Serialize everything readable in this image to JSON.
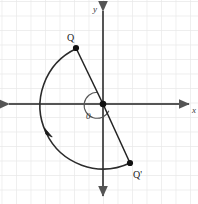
{
  "figure": {
    "width": 198,
    "height": 204,
    "background_color": "#ffffff",
    "grid": {
      "visible": true,
      "spacing_px": 14.5,
      "color": "#e8e8e8"
    },
    "axes": {
      "color": "#555555",
      "origin_px": [
        103,
        104
      ],
      "x_axis": {
        "label": "x",
        "label_pos_px": [
          191,
          110
        ],
        "arrows": "both"
      },
      "y_axis": {
        "label": "y",
        "label_pos_px": [
          95,
          12
        ],
        "arrows": "both"
      },
      "origin_label": {
        "text": "0",
        "pos_px": [
          87,
          117
        ]
      }
    },
    "points": [
      {
        "name": "Q",
        "label": "Q",
        "pos_px": [
          76,
          48
        ],
        "label_pos_px": [
          69,
          41
        ],
        "radius_px": 3.1,
        "color": "#111111"
      },
      {
        "name": "Qp",
        "label": "Q'",
        "pos_px": [
          130,
          163
        ],
        "label_pos_px": [
          134,
          179
        ],
        "radius_px": 3.1,
        "color": "#111111"
      }
    ],
    "segments": [
      {
        "name": "origin-to-Q",
        "from_px": [
          103,
          104
        ],
        "to_px": [
          76,
          48
        ],
        "color": "#222222"
      },
      {
        "name": "origin-to-Qp",
        "from_px": [
          103,
          104
        ],
        "to_px": [
          130,
          163
        ],
        "color": "#222222"
      }
    ],
    "arc": {
      "name": "rotation-arc",
      "description": "counterclockwise arc from Q sweeping left and around the bottom to Q'",
      "center_px": [
        103,
        104
      ],
      "radius_px": 62,
      "start_deg": 115,
      "end_deg": 295,
      "direction": "counterclockwise",
      "color": "#2a2a2a",
      "arrow_marker_px": [
        48,
        133
      ]
    },
    "angle_marker": {
      "name": "rotation-angle",
      "center_px": [
        103,
        104
      ],
      "radius_px": 13,
      "color": "#444444"
    }
  }
}
